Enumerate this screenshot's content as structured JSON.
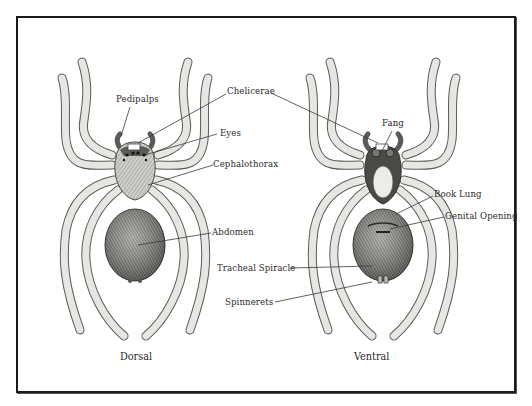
{
  "diagram": {
    "views": [
      {
        "name": "dorsal",
        "caption": "Dorsal"
      },
      {
        "name": "ventral",
        "caption": "Ventral"
      }
    ],
    "labels": {
      "pedipalps": "Pedipalps",
      "chelicerae": "Chelicerae",
      "eyes": "Eyes",
      "cephalothorax": "Cephalothorax",
      "abdomen": "Abdomen",
      "fang": "Fang",
      "book_lung": "Book Lung",
      "genital_opening": "Genital Opening",
      "tracheal_spiracle": "Tracheal Spiracle",
      "spinnerets": "Spinnerets"
    },
    "colors": {
      "ink": "#2a2a2a",
      "frame": "#1a1a1a",
      "leg_fill": "#e8e8e4",
      "body_fill": "#d6d6d2",
      "abdomen_fill": "#8a8a86",
      "background": "#ffffff"
    }
  }
}
